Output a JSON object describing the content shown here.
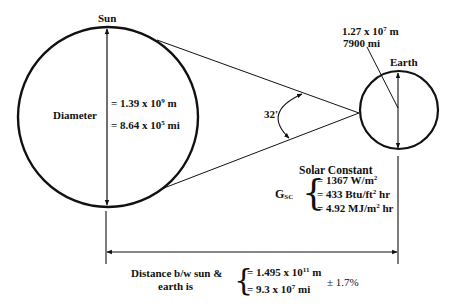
{
  "sun": {
    "title": "Sun",
    "diameter_label": "Diameter",
    "diameter_m_prefix": "= 1.39 x 10",
    "diameter_m_exp": "9",
    "diameter_m_unit": " m",
    "diameter_mi_prefix": "= 8.64 x 10",
    "diameter_mi_exp": "5",
    "diameter_mi_unit": " mi"
  },
  "earth": {
    "title": "Earth",
    "diameter_m_prefix": "1.27 x 10",
    "diameter_m_exp": "7",
    "diameter_m_unit": " m",
    "diameter_mi": "7900 mi"
  },
  "angle": {
    "label": "32'"
  },
  "solar_constant": {
    "title": "Solar Constant",
    "symbol": "G",
    "symbol_sub": "SC",
    "brace": "{",
    "value1_prefix": "= 1367 W/m",
    "value1_exp": "2",
    "value1_suffix": "",
    "value2_prefix": "= 433 Btu/ft",
    "value2_exp": "2",
    "value2_suffix": " hr",
    "value3_prefix": "= 4.92 MJ/m",
    "value3_exp": "2",
    "value3_suffix": " hr"
  },
  "distance": {
    "label_line1": "Distance b/w sun &",
    "label_line2": "earth is",
    "brace": "{",
    "value_m_prefix": "= 1.495 x 10",
    "value_m_exp": "11",
    "value_m_unit": " m",
    "value_mi_prefix": "= 9.3 x 10",
    "value_mi_exp": "7",
    "value_mi_unit": " mi",
    "tolerance": "± 1.7%"
  }
}
